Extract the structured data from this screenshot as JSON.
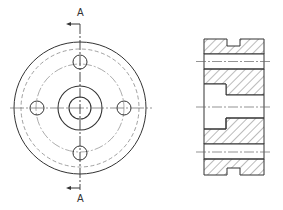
{
  "drawing": {
    "type": "engineering-drawing",
    "subject": "flange with four bolt holes",
    "views": [
      {
        "name": "front-view",
        "features": [
          "outer circle",
          "hidden outer circle",
          "pitch circle (center line)",
          "4 bolt holes",
          "hub circle",
          "central bore"
        ]
      },
      {
        "name": "section-view-A-A",
        "features": [
          "hatched cross-section",
          "two bolt hole passages",
          "stepped central bore",
          "grooves top and bottom"
        ]
      }
    ],
    "section_label_top": "A",
    "section_label_bottom": "A",
    "colors": {
      "line": "#333333",
      "hidden": "#888888",
      "hatch": "#555555",
      "background": "#ffffff"
    }
  }
}
